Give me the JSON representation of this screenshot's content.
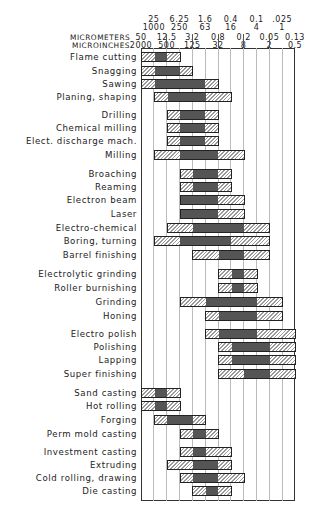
{
  "chart_data": {
    "type": "range-bar",
    "axis": {
      "top_row_micrometers": [
        "25",
        "6.25",
        "1.6",
        "0.4",
        "0.1",
        ".025"
      ],
      "top_row_microinches": [
        "1000",
        "250",
        "63",
        "16",
        "4",
        "1"
      ],
      "header_label_micrometers": "MICROMETERS",
      "header_label_microinches": "MICROINCHES",
      "bottom_row_micrometers": [
        "50",
        "12.5",
        "3.2",
        "0.8",
        "0.2",
        "0.05",
        "0.13"
      ],
      "bottom_row_microinches": [
        "2000",
        "500",
        "125",
        "32",
        "8",
        "2",
        "0.5"
      ],
      "column_boundaries_um": [
        50,
        25,
        12.5,
        6.25,
        3.2,
        1.6,
        0.8,
        0.4,
        0.2,
        0.1,
        0.05,
        0.025,
        0.0125
      ]
    },
    "legend": {
      "solid": "average application",
      "hatched": "less frequent application"
    },
    "processes": [
      {
        "name": "Flame cutting",
        "range": [
          0,
          3
        ],
        "solid": [
          1,
          2
        ]
      },
      {
        "name": "Snagging",
        "range": [
          0,
          4
        ],
        "solid": [
          1,
          3
        ]
      },
      {
        "name": "Sawing",
        "range": [
          0,
          6
        ],
        "solid": [
          1,
          5
        ]
      },
      {
        "name": "Planing, shaping",
        "range": [
          1,
          7
        ],
        "solid": [
          2,
          5
        ]
      },
      {
        "name": "Drilling",
        "range": [
          2,
          6
        ],
        "solid": [
          3,
          5
        ]
      },
      {
        "name": "Chemical milling",
        "range": [
          2,
          6
        ],
        "solid": [
          3,
          5
        ]
      },
      {
        "name": "Elect. discharge mach.",
        "range": [
          2,
          6
        ],
        "solid": [
          3,
          5
        ]
      },
      {
        "name": "Milling",
        "range": [
          1,
          8
        ],
        "solid": [
          3,
          6
        ]
      },
      {
        "name": "Broaching",
        "range": [
          3,
          7
        ],
        "solid": [
          4,
          6
        ]
      },
      {
        "name": "Reaming",
        "range": [
          3,
          7
        ],
        "solid": [
          4,
          6
        ]
      },
      {
        "name": "Electron beam",
        "range": [
          3,
          8
        ],
        "solid": [
          3,
          6
        ]
      },
      {
        "name": "Laser",
        "range": [
          3,
          8
        ],
        "solid": [
          3,
          6
        ]
      },
      {
        "name": "Electro-chemical",
        "range": [
          2,
          10
        ],
        "solid": [
          4,
          8
        ]
      },
      {
        "name": "Boring, turning",
        "range": [
          1,
          10
        ],
        "solid": [
          3,
          7
        ]
      },
      {
        "name": "Barrel finishing",
        "range": [
          4,
          10
        ],
        "solid": [
          6,
          8
        ]
      },
      {
        "name": "Electrolytic grinding",
        "range": [
          6,
          9
        ],
        "solid": [
          7,
          8
        ]
      },
      {
        "name": "Roller burnishing",
        "range": [
          6,
          9
        ],
        "solid": [
          7,
          8
        ]
      },
      {
        "name": "Grinding",
        "range": [
          3,
          11
        ],
        "solid": [
          5,
          9
        ]
      },
      {
        "name": "Honing",
        "range": [
          5,
          11
        ],
        "solid": [
          6,
          9
        ]
      },
      {
        "name": "Electro polish",
        "range": [
          5,
          12
        ],
        "solid": [
          6,
          9
        ]
      },
      {
        "name": "Polishing",
        "range": [
          6,
          12
        ],
        "solid": [
          7,
          10
        ]
      },
      {
        "name": "Lapping",
        "range": [
          6,
          12
        ],
        "solid": [
          7,
          10
        ]
      },
      {
        "name": "Super finishing",
        "range": [
          6,
          12
        ],
        "solid": [
          8,
          10
        ]
      },
      {
        "name": "Sand casting",
        "range": [
          0,
          3
        ],
        "solid": [
          1,
          2
        ]
      },
      {
        "name": "Hot rolling",
        "range": [
          0,
          3
        ],
        "solid": [
          1,
          2
        ]
      },
      {
        "name": "Forging",
        "range": [
          1,
          5
        ],
        "solid": [
          2,
          4
        ]
      },
      {
        "name": "Perm mold casting",
        "range": [
          3,
          6
        ],
        "solid": [
          4,
          5
        ]
      },
      {
        "name": "Investment casting",
        "range": [
          3,
          7
        ],
        "solid": [
          4,
          5
        ]
      },
      {
        "name": "Extruding",
        "range": [
          2,
          7
        ],
        "solid": [
          4,
          6
        ]
      },
      {
        "name": "Cold rolling, drawing",
        "range": [
          3,
          8
        ],
        "solid": [
          4,
          6
        ]
      },
      {
        "name": "Die casting",
        "range": [
          4,
          7
        ],
        "solid": [
          5,
          6
        ]
      }
    ],
    "row_y": [
      57,
      71,
      84,
      97,
      115,
      128,
      141,
      155,
      174,
      187,
      200,
      214,
      228,
      241,
      255,
      274,
      288,
      302,
      316,
      334,
      347,
      360,
      374,
      393,
      406,
      420,
      434,
      452,
      465,
      478,
      491
    ]
  }
}
